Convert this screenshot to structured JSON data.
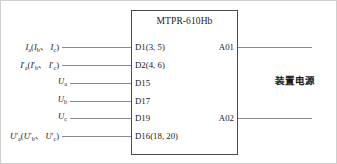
{
  "device": {
    "title": "MTPR-610Hb"
  },
  "inputs": [
    {
      "label_plain": "Ia(Ib、Ic)",
      "base": "I",
      "sub1": "a",
      "sub2": "b",
      "sub3": "c",
      "prime": false,
      "terminal": "D1(3, 5)"
    },
    {
      "label_plain": "I'a(I'b、I'c)",
      "base": "I",
      "sub1": "a",
      "sub2": "b",
      "sub3": "c",
      "prime": true,
      "terminal": "D2(4, 6)"
    },
    {
      "label_plain": "Ua",
      "base": "U",
      "sub1": "a",
      "prime": false,
      "single": true,
      "terminal": "D15"
    },
    {
      "label_plain": "Ub",
      "base": "U",
      "sub1": "b",
      "prime": false,
      "single": true,
      "terminal": "D17"
    },
    {
      "label_plain": "Uc",
      "base": "U",
      "sub1": "c",
      "prime": false,
      "single": true,
      "terminal": "D19"
    },
    {
      "label_plain": "U'a(U'b、U'c)",
      "base": "U",
      "sub1": "a",
      "sub2": "b",
      "sub3": "c",
      "prime": true,
      "terminal": "D16(18, 20)"
    }
  ],
  "outputs": [
    {
      "terminal": "A01"
    },
    {
      "terminal": "A02"
    }
  ],
  "power": {
    "label": "装置电源"
  },
  "separator": "、",
  "prime_mark": "′",
  "colors": {
    "box_border": "#4a4a4a",
    "wire": "#8a8a8a",
    "text": "#1a1a1a",
    "page_border": "#cfcfcf"
  }
}
